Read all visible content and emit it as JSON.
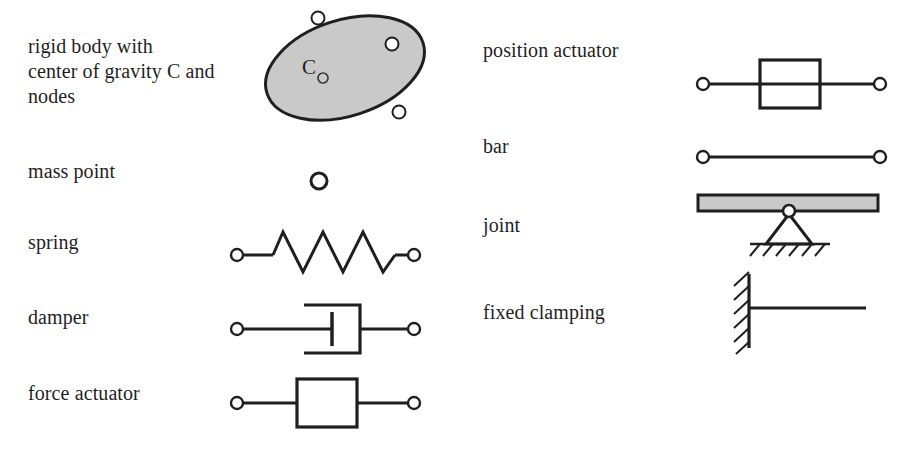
{
  "figure": {
    "kind": "mechanical-element-symbol-legend",
    "background_color": "#ffffff",
    "ink_color": "#1f1f1f",
    "fill_gray": "#c8c8c8"
  },
  "left_column": {
    "items": [
      {
        "key": "rigid-body",
        "label": "rigid body with\ncenter of gravity C and\nnodes",
        "symbol": "ellipse-with-nodes"
      },
      {
        "key": "mass-point",
        "label": "mass point",
        "symbol": "small-circle"
      },
      {
        "key": "spring",
        "label": "spring",
        "symbol": "zigzag-spring"
      },
      {
        "key": "damper",
        "label": "damper",
        "symbol": "dashpot"
      },
      {
        "key": "force-actuator",
        "label": "force actuator",
        "symbol": "box-inline"
      }
    ]
  },
  "right_column": {
    "items": [
      {
        "key": "position-actuator",
        "label": "position actuator",
        "symbol": "box-overline"
      },
      {
        "key": "bar",
        "label": "bar",
        "symbol": "line-with-end-nodes"
      },
      {
        "key": "joint",
        "label": "joint",
        "symbol": "pin-support"
      },
      {
        "key": "fixed-clamping",
        "label": "fixed clamping",
        "symbol": "wall-hatch"
      }
    ]
  },
  "rigid_body": {
    "center_label": "C",
    "node_count": 3,
    "fill": "#c9c9c9",
    "stroke": "#1f1f1f"
  },
  "joint": {
    "bar_fill": "#c9c9c9",
    "bar_stroke": "#1f1f1f",
    "hatch_count": 6
  },
  "fixed_clamping": {
    "hatch_count": 6
  },
  "spring": {
    "coil_count": 4
  },
  "colors": {
    "ink": "#1f1f1f",
    "gray_fill": "#c9c9c9",
    "paper": "#ffffff"
  }
}
